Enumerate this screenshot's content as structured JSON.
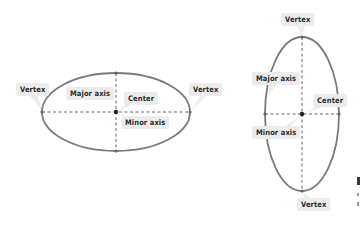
{
  "figure": {
    "horizontal_ellipse": {
      "labels": {
        "vertex_left": "Vertex",
        "major_axis": "Major axis",
        "center": "Center",
        "minor_axis": "Minor axis",
        "vertex_right": "Vertex"
      }
    },
    "vertical_ellipse": {
      "labels": {
        "vertex_top": "Vertex",
        "major_axis": "Major axis",
        "center": "Center",
        "minor_axis": "Minor axis",
        "vertex_bottom": "Vertex"
      }
    }
  },
  "colors": {
    "ellipse_stroke": "#7a7a7a",
    "axis_dash": "#555555",
    "point": "#333333",
    "label_bg": "#ececec",
    "label_text": "#2b2b2b"
  }
}
